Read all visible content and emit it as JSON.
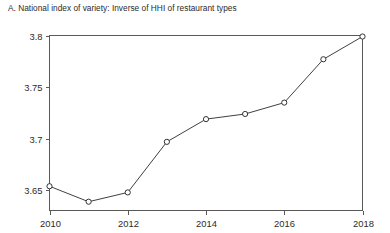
{
  "figure": {
    "panel_label": "A.",
    "title": "A. National index of variety: Inverse of HHI of restaurant types",
    "background_color": "#ffffff",
    "frame_color": "#595959",
    "line_color": "#404040",
    "marker_fill_color": "#ffffff",
    "marker_stroke_color": "#333333"
  },
  "chart_data": {
    "type": "line",
    "title": "A. National index of variety: Inverse of HHI of restaurant types",
    "xlabel": "",
    "ylabel": "",
    "x": [
      2010,
      2011,
      2012,
      2013,
      2014,
      2015,
      2016,
      2017,
      2018
    ],
    "values": [
      3.654,
      3.639,
      3.648,
      3.697,
      3.719,
      3.724,
      3.735,
      3.777,
      3.799
    ],
    "series": [
      {
        "name": "National index of variety",
        "values": [
          3.654,
          3.639,
          3.648,
          3.697,
          3.719,
          3.724,
          3.735,
          3.777,
          3.799
        ]
      }
    ],
    "xlim": [
      2010,
      2018
    ],
    "ylim": [
      3.6305,
      3.8
    ],
    "xticks": [
      2010,
      2012,
      2014,
      2016,
      2018
    ],
    "xtick_labels": [
      "2010",
      "2012",
      "2014",
      "2016",
      "2018"
    ],
    "yticks": [
      3.65,
      3.7,
      3.75,
      3.8
    ],
    "ytick_labels": [
      "3.65",
      "3.7",
      "3.75",
      "3.8"
    ],
    "grid": false,
    "legend": false,
    "marker": "open-circle"
  }
}
